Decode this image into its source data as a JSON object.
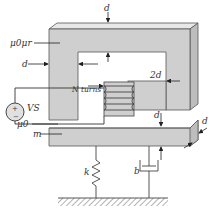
{
  "diagram": {
    "labels": {
      "core_material": "μ0μr",
      "core_thickness_left": "d",
      "core_thickness_top": "d",
      "coil_turns": "N turns",
      "pole_width": "2d",
      "source": "VS",
      "source_plus": "+",
      "source_minus": "−",
      "air_gap": "μ0",
      "mass": "m",
      "gap_right": "d",
      "depth": "d",
      "spring": "k",
      "damper": "b"
    },
    "colors": {
      "core_fill": "#cfcfcf",
      "core_stroke": "#555555",
      "background": "#ffffff",
      "ground_hatch": "#666666"
    }
  }
}
